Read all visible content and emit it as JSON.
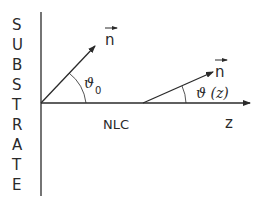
{
  "diagram": {
    "substrate_label": [
      "S",
      "U",
      "B",
      "S",
      "T",
      "R",
      "A",
      "T",
      "E"
    ],
    "medium_label": "NLC",
    "axis_label": "z",
    "director_label_1": "n",
    "director_label_2": "n",
    "angle_label_1": "ϑ",
    "angle_label_1_sub": "0",
    "angle_label_2": "ϑ (z)",
    "line_color": "#2a2a2a",
    "background": "#ffffff"
  }
}
